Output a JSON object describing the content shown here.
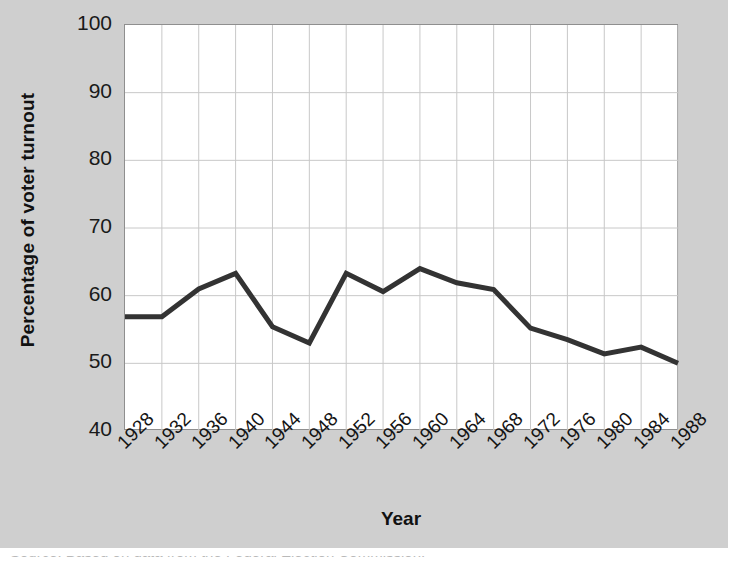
{
  "figure": {
    "background_color": "#cfcfcf",
    "plot_background_color": "#ffffff",
    "line_color": "#333333",
    "grid_color": "#c8c8c8",
    "clipped_caption": "Source: Based on data from the Federal Election Commission."
  },
  "chart_data": {
    "type": "line",
    "title": "",
    "xlabel": "Year",
    "ylabel": "Percentage of voter turnout",
    "categories": [
      "1928",
      "1932",
      "1936",
      "1940",
      "1944",
      "1948",
      "1952",
      "1956",
      "1960",
      "1964",
      "1968",
      "1972",
      "1976",
      "1980",
      "1984",
      "1988"
    ],
    "values": [
      56.9,
      56.9,
      61.0,
      63.3,
      55.4,
      53.0,
      63.3,
      60.6,
      64.0,
      61.9,
      60.9,
      55.2,
      53.5,
      51.4,
      52.4,
      50.0
    ],
    "ylim": [
      40,
      100
    ],
    "yticks": [
      "40",
      "50",
      "60",
      "70",
      "80",
      "90",
      "100"
    ],
    "ytick_values": [
      40,
      50,
      60,
      70,
      80,
      90,
      100
    ],
    "grid": true,
    "legend": "none",
    "series": [
      {
        "name": "Percentage of voter turnout",
        "values": [
          56.9,
          56.9,
          61.0,
          63.3,
          55.4,
          53.0,
          63.3,
          60.6,
          64.0,
          61.9,
          60.9,
          55.2,
          53.5,
          51.4,
          52.4,
          50.0
        ]
      }
    ]
  }
}
